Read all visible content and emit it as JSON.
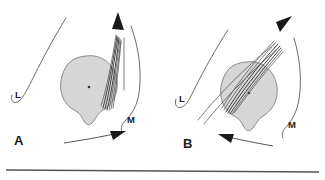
{
  "figure": {
    "width": 325,
    "height": 180,
    "background": "#ffffff",
    "rule_color": "#555555",
    "blob_fill": "#d6d6d6",
    "blob_stroke": "#8a8a8a",
    "line_color": "#6b6b6b",
    "fiber_color": "#2e2e2e",
    "arrow_color": "#1a1a1a",
    "text_color": "#1a1a1a"
  },
  "panels": [
    {
      "id": "A",
      "letter": "A",
      "labels": {
        "lateral": "L",
        "medial": "M"
      },
      "motion_arrow_direction": "right",
      "spindle_arrow_direction": "up",
      "fiber_count": 7
    },
    {
      "id": "B",
      "letter": "B",
      "labels": {
        "lateral": "L",
        "medial": "M"
      },
      "motion_arrow_direction": "left",
      "spindle_arrow_direction": "up-right",
      "fiber_count": 7
    }
  ]
}
